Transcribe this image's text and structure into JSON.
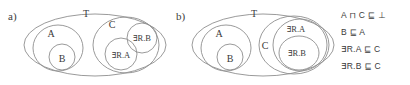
{
  "figure": {
    "panels": [
      {
        "id": "a",
        "label": "a)",
        "universe_label": "T",
        "sets": [
          {
            "name": "A",
            "label": "A"
          },
          {
            "name": "B",
            "label": "B"
          },
          {
            "name": "C",
            "label": "C"
          },
          {
            "name": "exists-R-A",
            "label": "∃R.A"
          },
          {
            "name": "exists-R-B",
            "label": "∃R.B"
          }
        ]
      },
      {
        "id": "b",
        "label": "b)",
        "universe_label": "T",
        "sets": [
          {
            "name": "A",
            "label": "A"
          },
          {
            "name": "B",
            "label": "B"
          },
          {
            "name": "C",
            "label": "C"
          },
          {
            "name": "exists-R-A",
            "label": "∃R.A"
          },
          {
            "name": "exists-R-B",
            "label": "∃R.B"
          }
        ]
      }
    ]
  },
  "axioms": [
    {
      "id": "axiom-1",
      "text": "A ⊓ C ⊑ ⊥"
    },
    {
      "id": "axiom-2",
      "text": "B ⊑ A"
    },
    {
      "id": "axiom-3",
      "text": "∃R.A ⊑ C"
    },
    {
      "id": "axiom-4",
      "text": "∃R.B ⊑ C"
    }
  ],
  "colors": {
    "stroke": "#8e8e8e",
    "text": "#3a3a3a",
    "background": "#ffffff"
  }
}
